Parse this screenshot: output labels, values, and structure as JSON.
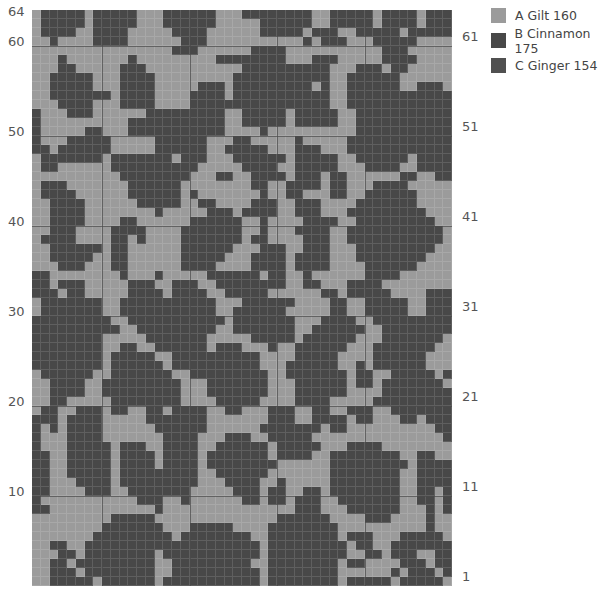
{
  "chart_data": {
    "type": "heatmap",
    "title": "",
    "columns": 48,
    "rows": 64,
    "left_row_labels": [
      {
        "label": "64",
        "row": 64
      },
      {
        "label": "60",
        "row": 60
      },
      {
        "label": "50",
        "row": 50
      },
      {
        "label": "40",
        "row": 40
      },
      {
        "label": "30",
        "row": 30
      },
      {
        "label": "20",
        "row": 20
      },
      {
        "label": "10",
        "row": 10
      }
    ],
    "right_row_labels": [
      {
        "label": "61",
        "row": 61
      },
      {
        "label": "51",
        "row": 51
      },
      {
        "label": "41",
        "row": 41
      },
      {
        "label": "31",
        "row": 31
      },
      {
        "label": "21",
        "row": 21
      },
      {
        "label": "11",
        "row": 11
      },
      {
        "label": "1",
        "row": 1
      }
    ],
    "major_vertical_after_columns": [
      8,
      18,
      28,
      38
    ],
    "major_horizontal_after_rows_from_top": [
      4,
      14,
      24,
      34,
      44,
      54
    ],
    "legend": [
      {
        "key": "A",
        "name": "Gilt",
        "code": "160",
        "label": "A  Gilt 160",
        "color": "#9b9b9b"
      },
      {
        "key": "B",
        "name": "Cinnamon",
        "code": "175",
        "label": "B  Cinnamon 175",
        "color": "#484848"
      },
      {
        "key": "C",
        "name": "Ginger",
        "code": "154",
        "label": "C  Ginger 154",
        "color": "#505050"
      }
    ],
    "grid_rows_top_to_bottom": [
      ".BBBBB.BBBBB...BBBBBB...BBBBBBBB..BBBBB.BBBB.BBB",
      ".BBBBB.BBBBB...BBBBBB.....BBBBBB..BBBBB.BBBB.BBB",
      ".BBBB..BBBB.....BBBB......BBBBB.BBB..BBBBB.BBBBB",
      "..B....BBBB......BBB...........B.BBB...BBBBB....",
      "................BBB......BBBB...........BBB.....",
      "...B.......B.........BBBBBBBB...BBB.....BBBB....",
      "...BB.....BBB...........BBBBBBBBBB...BBB.BB.....",
      "..BBBBB...BBBB.........BBBBBBBBBBB..BBBBBB......",
      "..BBBBB...BBBB.....BBB.BBBBBBBBB.B..BBBBBB..BBB.",
      "..BBBBBBB.BBBB....BBBB.BBBBBBBBBBB..BBBBBBBBBBBB",
      "...BBBB...BBBB....BBBBBBBBBBBBBBBB..BBBBBBBBBBBB",
      "B...BBB......BBBBBBBBB..BBBBB.BBBBB..BBBBBBBBBBB",
      "B..........BBBBBBBBBBB..BBBBB.BBBBB..BBBBBBBBBBB",
      "B.....BB...BBBBBBBBBBB....B..........BBBBBBBBBBB",
      "B...BBBBB.....BBBBBB...BB.....B.....BBBBBBBBBBBB",
      "BB.BBBBBB.....BBBBBB..BBBBB...BBB...BBBBBBBBBBBB",
      ".BBBBBBB.BBBBBBB.BBB...BBBBBB.BBBBB..BBBBBB.BBBB",
      ".BB......BBBBBBBBBB.....BBBB..BBBBB...BBBB..BBBB",
      "..........BBBBBBBB...BB..BBBB.BBB.BB......BB..BB",
      ".BBB.......BBBBBB........BB..BBBB.BB...BBBB.....",
      ".BBBB......BBBBBB.B.......B..BB...BB..BBBBBB....",
      "..BBBB......BBBBB..BB....BBB..BBB....BBBBBBB....",
      "..BBBB........B.....BBB.BBBB..BBB...BBBBBBBBB...",
      "..BBBB....BB......BBBBBB..B....BBBB..BBBBBBBBB..",
      "..BBB....BBBB....BBBBBBB..B...BBBB..BBBBBBBBBBB.",
      ".BBBB....BB.B....BBBBBBB.BB....BBB..BBBBBBBBBBB.",
      "..BBBBBB.BB......BBBBBB...BBB..BBB...BBBBBBBBB..",
      "..BBBBB..BB......BBBBB...BBBB.BBBB...BBBBBBBB...",
      "...BBB...BB......BBBB....BBBB.BBBB....BBBBBB....",
      "BB........B...B.....BBBBBB.BB..B......BBBB......",
      "BB.BBB.....BBB..BBB..BBBBBBBB..BB...BBBB........",
      "BBB.BB.....BBBB.BBBB..BBBBB......BB.BBBBB....BBB",
      ".BBBBBBB..BBBBBBBBBBB...BBBBBB....BB..BBBBB..BBB",
      ".BBBBBBB..BBBBBBBBBBB..BBBBBB.....BB..BBBBB..BBB",
      "BBBBBBBBB..BBBBBBBBBBB.BBBBBBB...BBBB..BBBBBBBBB",
      "BBBBBBBBBB..BBBBBBBBB..BBBBBBB..BBBBBB..BBBBBBBB",
      "BBBBBBBB.....BBBBBBB.....BBBBB.BBBBBB...BBBBBBB.",
      "BBBBBBBB..BB..BBBBBB.BBB...B..BBBBBB...BBBBBBB..",
      "BBBBBBBB.BBBBB..BBBBBBBBBB....BBBBB....BBBBBB...",
      "BBBBBBBB.BBBBBB.BBBBBBBBBB...BBBBBB..B.BBBBBB...",
      ".BBBBBB..BBBBBBB..BBBBBBBBB..BBBBBBB.BB..BBBBB.B",
      "..BBBB..BBBBBBBBB...BBBBBBB...BBBBBB.BB.BBBBBBB.",
      "..BBBB..BBBBBBBBB...BBBBBBB...BBBBBB....BBBBBBBB",
      "..BB.....BBBBBBBB....BBBBB....BBBB.....BBBBBBBBB",
      ".BB..BBB.BB..BB.BBBB..BB...BBB..BB..BBB..BBBBBBB",
      "BBB.BBBB.....BBBBBBB.......BBB..BBBB.BB...BB.BBB",
      "B.B.BBBB......BBBBBB......BBBBBBB.BB..........BB",
      "B...BBBB.......BBBB...BBB..BBBBB...............B",
      "B...BBBBB.BBB..BBBB..BBBBBB.BBBBB...BBBB........",
      "BB..BBBBB.BBBB.BBBB.BBBBBBB.BBBB..BBBBBBBB..BB..",
      "BB..BBBBB.BBBB.BBBB.BBBBBBBB......BBBBBBBBB.BBBB",
      "BB..BBBBB.BBBBBBBBB..BBBBBB.......BBBBBBBB..BBBB",
      "BB...BBBB.BBBBBBBBB...BBBB..B.....BBBBBBBB..BBBB",
      "BB....BBB..BBBBBBB.....BBB.BB..BB.BBBBBBBB..BB.B",
      "B...........BBB..B......BB.BB.BBB..BBBBBBB..BB.B",
      "BB............B...............BBB...BBBBBB...B.B",
      ".........BBBBB..............BBBBBB....BBB....B..",
      "........BBBBBBB...BBBBB....BBBBBBBB..........B..",
      ".......BBBBBBBBB.BBBBBBBB..BBBBBBBB.BBB...BBBBB.",
      "..BB..BBBBBBBBBBBBBBBBBBBB.BBBBBBBBB.BB..BBBBBBB",
      "...BB.BBBBBBBB.BBBBBBBBBBB.BBBBBBBBB..BB.BBB..BB",
      "..BB.BBBBBBBBB..BBBBBBBBB..BBBBBBBB.BB....BBB.BB",
      "..BBB.BBBBBBBB..BBBBBBBBBB.BBBBBBBB......B.BBB.B",
      "..BBBBB.BBBBBB.BBBBBBBBBBB.BBBBBBBB.BBBBB.BBBBB."
    ]
  },
  "bottom_caption_partial": ""
}
